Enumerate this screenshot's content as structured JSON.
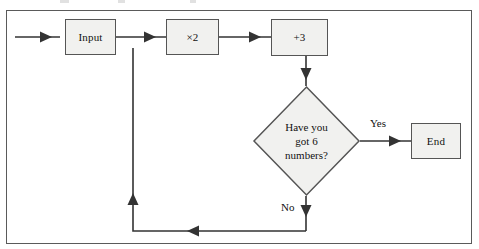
{
  "diagram": {
    "frame": {
      "border_color": "#5a5a5a",
      "background": "#ffffff"
    },
    "node_style": {
      "fill": "#f1f1ef",
      "stroke": "#555555"
    },
    "nodes": [
      {
        "id": "input",
        "label": "Input",
        "shape": "rect"
      },
      {
        "id": "times2",
        "label": "×2",
        "shape": "rect"
      },
      {
        "id": "plus3",
        "label": "+3",
        "shape": "rect"
      },
      {
        "id": "decision",
        "label_lines": [
          "Have you",
          "got 6",
          "numbers?"
        ],
        "shape": "diamond"
      },
      {
        "id": "end",
        "label": "End",
        "shape": "rect"
      }
    ],
    "edge_labels": {
      "yes": "Yes",
      "no": "No"
    }
  }
}
